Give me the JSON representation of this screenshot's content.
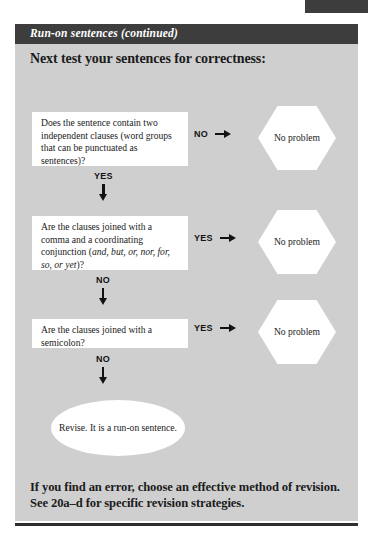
{
  "page": {
    "header_title": "Run-on sentences (continued)",
    "section_heading": "Next test your sentences for correctness:",
    "footer_note": "If you find an error, choose an effective method of revision. See 20a–d for specific revision strategies."
  },
  "flowchart": {
    "questions": [
      {
        "text_before_italic": "Does the sentence contain two independent clauses (word groups that can be punctuated as sentences)?",
        "italic": "",
        "text_after_italic": ""
      },
      {
        "text_before_italic": "Are the clauses joined with a comma and a coordinating conjunction (",
        "italic": "and, but, or, nor, for, so, or yet",
        "text_after_italic": ")?"
      },
      {
        "text_before_italic": "Are the clauses joined with a semicolon?",
        "italic": "",
        "text_after_italic": ""
      }
    ],
    "branches": [
      {
        "label": "NO",
        "outcome": "No problem"
      },
      {
        "label": "YES",
        "outcome": "No problem"
      },
      {
        "label": "YES",
        "outcome": "No problem"
      }
    ],
    "continues": [
      {
        "label": "YES"
      },
      {
        "label": "NO"
      },
      {
        "label": "NO"
      }
    ],
    "terminal": "Revise. It is a run-on sentence."
  },
  "colors": {
    "header_bar": "#3d3d3d",
    "panel_background": "#cfcfcf",
    "node_fill": "#ffffff",
    "ink": "#1a1a1a"
  }
}
